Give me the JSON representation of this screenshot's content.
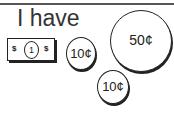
{
  "title": "I have",
  "bill": {
    "symbol_left": "$",
    "value": "1",
    "symbol_right": "$"
  },
  "coins": [
    {
      "label": "10¢"
    },
    {
      "label": "50¢"
    },
    {
      "label": "10¢"
    }
  ]
}
